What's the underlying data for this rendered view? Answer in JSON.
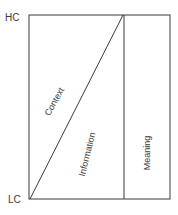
{
  "diagram": {
    "axis_labels": {
      "top": "HC",
      "bottom": "LC"
    },
    "regions": {
      "context": "Context",
      "information": "Information",
      "meaning": "Meaning"
    },
    "colors": {
      "line": "#3a3a3a",
      "text": "#3a3a3a",
      "background": "#ffffff"
    }
  }
}
